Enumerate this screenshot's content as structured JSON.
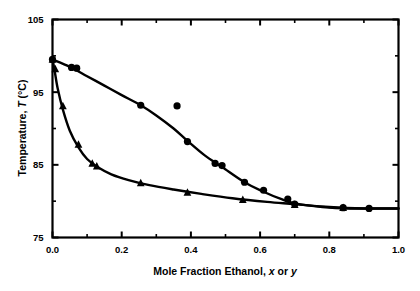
{
  "chart_data": {
    "type": "scatter",
    "title": "",
    "xlabel": "Mole Fraction Ethanol, x or y",
    "xlabel_parts": {
      "lead": "Mole Fraction Ethanol,",
      "x_symbol": "x",
      "conjunction": "or",
      "y_symbol": "y"
    },
    "ylabel": "Temperature, T (°C)",
    "ylabel_parts": {
      "lead": "Temperature,",
      "t_symbol": "T",
      "units": "(°C)"
    },
    "xlim": [
      0.0,
      1.0
    ],
    "ylim": [
      75,
      105
    ],
    "xticks": [
      0.0,
      0.2,
      0.4,
      0.6,
      0.8,
      1.0
    ],
    "xtick_labels": [
      "0.0",
      "0.2",
      "0.4",
      "0.6",
      "0.8",
      "1.0"
    ],
    "xticks_minor": [
      0.1,
      0.3,
      0.5,
      0.7,
      0.9
    ],
    "yticks": [
      75,
      85,
      95,
      105
    ],
    "ytick_labels": [
      "75",
      "85",
      "95",
      "105"
    ],
    "yticks_minor": [
      80,
      90,
      100
    ],
    "grid": false,
    "legend": "none",
    "frame": "box",
    "series": [
      {
        "name": "dew-curve-vapor",
        "marker": "circle",
        "color": "#000000",
        "points": [
          {
            "x": 0.0,
            "y": 99.5
          },
          {
            "x": 0.055,
            "y": 98.4
          },
          {
            "x": 0.07,
            "y": 98.3
          },
          {
            "x": 0.255,
            "y": 93.2
          },
          {
            "x": 0.36,
            "y": 93.1
          },
          {
            "x": 0.39,
            "y": 88.2
          },
          {
            "x": 0.47,
            "y": 85.2
          },
          {
            "x": 0.49,
            "y": 84.9
          },
          {
            "x": 0.555,
            "y": 82.6
          },
          {
            "x": 0.61,
            "y": 81.5
          },
          {
            "x": 0.68,
            "y": 80.3
          },
          {
            "x": 0.7,
            "y": 79.6
          },
          {
            "x": 0.84,
            "y": 79.1
          },
          {
            "x": 0.915,
            "y": 79.0
          }
        ],
        "fit_curve": [
          {
            "x": 0.0,
            "y": 99.5
          },
          {
            "x": 0.05,
            "y": 98.5
          },
          {
            "x": 0.1,
            "y": 97.2
          },
          {
            "x": 0.15,
            "y": 95.9
          },
          {
            "x": 0.2,
            "y": 94.6
          },
          {
            "x": 0.255,
            "y": 93.2
          },
          {
            "x": 0.3,
            "y": 91.8
          },
          {
            "x": 0.35,
            "y": 90.0
          },
          {
            "x": 0.39,
            "y": 88.3
          },
          {
            "x": 0.44,
            "y": 86.3
          },
          {
            "x": 0.49,
            "y": 84.7
          },
          {
            "x": 0.555,
            "y": 82.6
          },
          {
            "x": 0.61,
            "y": 81.3
          },
          {
            "x": 0.66,
            "y": 80.3
          },
          {
            "x": 0.7,
            "y": 79.7
          },
          {
            "x": 0.78,
            "y": 79.2
          },
          {
            "x": 0.86,
            "y": 79.0
          },
          {
            "x": 1.0,
            "y": 79.0
          }
        ]
      },
      {
        "name": "bubble-curve-liquid",
        "marker": "triangle",
        "color": "#000000",
        "points": [
          {
            "x": 0.0,
            "y": 99.5
          },
          {
            "x": 0.008,
            "y": 98.2
          },
          {
            "x": 0.03,
            "y": 93.1
          },
          {
            "x": 0.075,
            "y": 87.8
          },
          {
            "x": 0.115,
            "y": 85.2
          },
          {
            "x": 0.128,
            "y": 84.8
          },
          {
            "x": 0.255,
            "y": 82.5
          },
          {
            "x": 0.39,
            "y": 81.2
          },
          {
            "x": 0.55,
            "y": 80.2
          },
          {
            "x": 0.7,
            "y": 79.5
          },
          {
            "x": 0.84,
            "y": 79.1
          }
        ],
        "fit_curve": [
          {
            "x": 0.0,
            "y": 99.6
          },
          {
            "x": 0.006,
            "y": 98.0
          },
          {
            "x": 0.015,
            "y": 95.5
          },
          {
            "x": 0.03,
            "y": 92.6
          },
          {
            "x": 0.05,
            "y": 89.7
          },
          {
            "x": 0.075,
            "y": 87.4
          },
          {
            "x": 0.1,
            "y": 85.8
          },
          {
            "x": 0.13,
            "y": 84.7
          },
          {
            "x": 0.17,
            "y": 83.7
          },
          {
            "x": 0.22,
            "y": 82.9
          },
          {
            "x": 0.28,
            "y": 82.2
          },
          {
            "x": 0.35,
            "y": 81.6
          },
          {
            "x": 0.43,
            "y": 81.0
          },
          {
            "x": 0.52,
            "y": 80.4
          },
          {
            "x": 0.62,
            "y": 79.9
          },
          {
            "x": 0.7,
            "y": 79.6
          },
          {
            "x": 0.8,
            "y": 79.2
          },
          {
            "x": 0.9,
            "y": 79.0
          },
          {
            "x": 1.0,
            "y": 79.0
          }
        ]
      }
    ]
  }
}
